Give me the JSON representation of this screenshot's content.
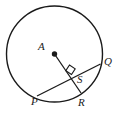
{
  "figure": {
    "type": "circle-geometry-diagram",
    "background_color": "#ffffff",
    "stroke_color": "#1a1a1a",
    "circle": {
      "name": "circle-A",
      "center_x": 54.5,
      "center_y": 54,
      "radius": 48
    },
    "center_point": {
      "name": "center-point-A",
      "x": 54.5,
      "y": 54,
      "dot_radius": 2.6
    },
    "chord": {
      "name": "chord-PQ",
      "from": {
        "label": "P",
        "x": 37,
        "y": 96
      },
      "to": {
        "label": "Q",
        "x": 100.5,
        "y": 64
      }
    },
    "radius_segment": {
      "name": "radius-AR",
      "from": {
        "label": "A",
        "x": 54.5,
        "y": 54
      },
      "to": {
        "label": "R",
        "x": 81,
        "y": 93
      }
    },
    "intersection_point": {
      "name": "point-S",
      "x": 71.5,
      "y": 74.5
    },
    "right_angle_marker": {
      "name": "right-angle-marker-at-S",
      "size": 8,
      "points": "71.5,74.5 65.8,70.6 69.5,65.0 75.2,68.9"
    },
    "labels": {
      "center": "A",
      "chord_end_right": "Q",
      "chord_end_left": "P",
      "radius_end": "R",
      "intersection": "S"
    }
  }
}
